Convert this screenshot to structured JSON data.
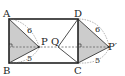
{
  "diagram": {
    "type": "geometry",
    "points": {
      "A": {
        "label": "A",
        "x": 9,
        "y": 19
      },
      "B": {
        "label": "B",
        "x": 9,
        "y": 63
      },
      "C": {
        "label": "C",
        "x": 78,
        "y": 63
      },
      "D": {
        "label": "D",
        "x": 78,
        "y": 19
      },
      "P": {
        "label": "P",
        "x": 39,
        "y": 47
      },
      "Q": {
        "label": "Q",
        "x": 58,
        "y": 47
      },
      "P_prime": {
        "label": "P′",
        "x": 109,
        "y": 47
      }
    },
    "lengths": {
      "AP": "6",
      "BP": "5",
      "DP_prime": "6",
      "CP_prime": "5"
    },
    "colors": {
      "stroke": "#222222",
      "shade": "#c8c8c8",
      "dash": "#555555"
    }
  }
}
